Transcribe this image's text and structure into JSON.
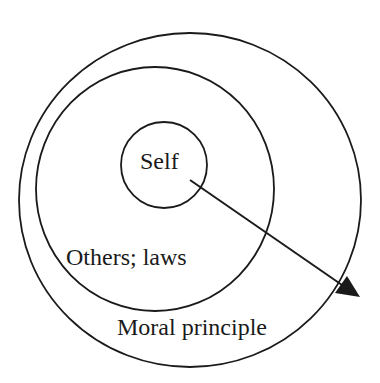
{
  "diagram": {
    "type": "nested-circles",
    "circles": [
      {
        "id": "outer",
        "label": "Moral principle",
        "cx": 190,
        "cy": 200,
        "rx": 171,
        "ry": 167
      },
      {
        "id": "middle",
        "label": "Others; laws",
        "cx": 155,
        "cy": 189,
        "rx": 119,
        "ry": 122
      },
      {
        "id": "inner",
        "label": "Self",
        "cx": 164,
        "cy": 165,
        "rx": 43,
        "ry": 43
      }
    ],
    "arrow": {
      "from": [
        190,
        180
      ],
      "to": [
        359,
        296
      ]
    },
    "colors": {
      "stroke": "#1a1a1a",
      "background": "#ffffff"
    }
  },
  "labels": {
    "self": "Self",
    "others": "Others; laws",
    "moral": "Moral principle"
  }
}
